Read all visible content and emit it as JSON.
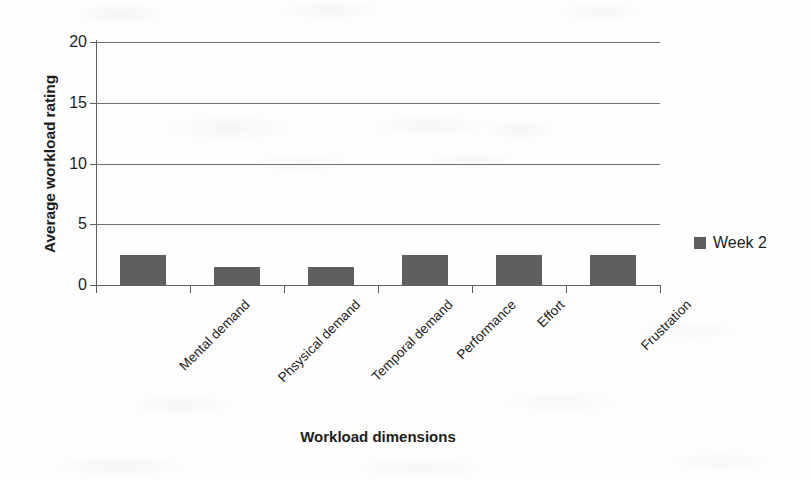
{
  "chart_data": {
    "type": "bar",
    "title": "",
    "subtitle": "",
    "xlabel": "Workload dimensions",
    "ylabel": "Average workload rating",
    "categories": [
      "Mental demand",
      "Phsysical demand",
      "Temporal demand",
      "Performance",
      "Effort",
      "Frustration"
    ],
    "series": [
      {
        "name": "Week 2",
        "color": "#5e5e5e",
        "values": [
          2.5,
          1.5,
          1.5,
          2.5,
          2.5,
          2.5
        ]
      }
    ],
    "ylim": [
      0,
      20
    ],
    "yticks": [
      0,
      5,
      10,
      15,
      20
    ],
    "ytick_labels": [
      "0",
      "5",
      "10",
      "15",
      "20"
    ],
    "grid": "horizontal",
    "legend_position": "right",
    "legend_entries": [
      {
        "label": "Week 2",
        "color": "#5e5e5e",
        "marker": "square-swatch"
      }
    ],
    "axis_color": "#5d5d5d",
    "gridline_color": "#6f6f6f",
    "background_color": "#fdfdfd",
    "category_label_rotation_deg": -45
  }
}
